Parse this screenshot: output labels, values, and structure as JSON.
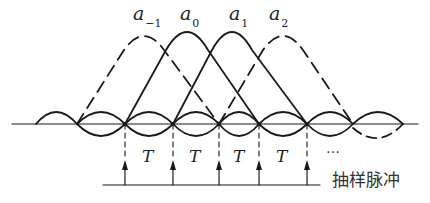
{
  "figure": {
    "coefficients": [
      {
        "base": "a",
        "sub": "−1",
        "style": "dashed",
        "peak_x": 144
      },
      {
        "base": "a",
        "sub": "0",
        "style": "solid",
        "peak_x": 187
      },
      {
        "base": "a",
        "sub": "1",
        "style": "solid",
        "peak_x": 232
      },
      {
        "base": "a",
        "sub": "2",
        "style": "dashed",
        "peak_x": 283
      }
    ],
    "interval_labels": [
      "T",
      "T",
      "T",
      "T"
    ],
    "continuation": "…",
    "caption": "抽样脉冲",
    "sample_positions_x": [
      125,
      173,
      219,
      259,
      307
    ],
    "line_color": "#1a1a1a"
  }
}
